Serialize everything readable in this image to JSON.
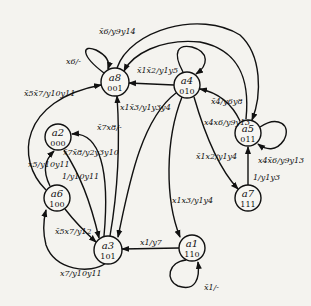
{
  "diagram": {
    "type": "state-machine",
    "nodes": [
      {
        "id": "a8",
        "label": "a8",
        "code": "001",
        "x": 115,
        "y": 82
      },
      {
        "id": "a4",
        "label": "a4",
        "code": "010",
        "x": 187,
        "y": 85
      },
      {
        "id": "a5",
        "label": "a5",
        "code": "011",
        "x": 248,
        "y": 133
      },
      {
        "id": "a7",
        "label": "a7",
        "code": "111",
        "x": 248,
        "y": 198
      },
      {
        "id": "a2",
        "label": "a2",
        "code": "000",
        "x": 58,
        "y": 137
      },
      {
        "id": "a6",
        "label": "a6",
        "code": "100",
        "x": 57,
        "y": 198
      },
      {
        "id": "a3",
        "label": "a3",
        "code": "101",
        "x": 108,
        "y": 250
      },
      {
        "id": "a1",
        "label": "a1",
        "code": "110",
        "x": 192,
        "y": 248
      }
    ],
    "edges": [
      {
        "from": "a8",
        "to": "a8",
        "label": "x6/-"
      },
      {
        "from": "a8",
        "to": "a5",
        "label": "x̄6/y9y14"
      },
      {
        "from": "a5",
        "to": "a8",
        "label": ""
      },
      {
        "from": "a4",
        "to": "a8",
        "label": "x̄1x̄2/y1y5"
      },
      {
        "from": "a4",
        "to": "a3",
        "label": "x1x̄3/y1y3y4"
      },
      {
        "from": "a3",
        "to": "a8",
        "label": "x̄7x8/-"
      },
      {
        "from": "a6",
        "to": "a8",
        "label": "x̄5x̄7/y10y11"
      },
      {
        "from": "a3",
        "to": "a2",
        "label": "x̄7x̄8/y2y3y10"
      },
      {
        "from": "a6",
        "to": "a2",
        "label": "x5/y10y11"
      },
      {
        "from": "a2",
        "to": "a3",
        "label": "1/y10y11"
      },
      {
        "from": "a6",
        "to": "a3",
        "label": "x̄5x7/y12"
      },
      {
        "from": "a3",
        "to": "a6",
        "label": "x7/y10y11"
      },
      {
        "from": "a4",
        "to": "a4",
        "label": "x̄4/y6y8"
      },
      {
        "from": "a5",
        "to": "a4",
        "label": "x4x6/y9y13"
      },
      {
        "from": "a5",
        "to": "a5",
        "label": "x4x̄6/y9y13"
      },
      {
        "from": "a4",
        "to": "a7",
        "label": "x̄1x2/y1y4"
      },
      {
        "from": "a7",
        "to": "a5",
        "label": "1/y1y3"
      },
      {
        "from": "a4",
        "to": "a1",
        "label": "x1x3/y1y4"
      },
      {
        "from": "a1",
        "to": "a3",
        "label": "x1/y7"
      },
      {
        "from": "a1",
        "to": "a1",
        "label": "x̄1/-"
      }
    ]
  },
  "labels": {
    "a8": "a8",
    "a8_code": "001",
    "a4": "a4",
    "a4_code": "010",
    "a5": "a5",
    "a5_code": "011",
    "a7": "a7",
    "a7_code": "111",
    "a2": "a2",
    "a2_code": "000",
    "a6": "a6",
    "a6_code": "100",
    "a3": "a3",
    "a3_code": "101",
    "a1": "a1",
    "a1_code": "110",
    "e_a8_self": "x6/-",
    "e_a8_a5": "x̄6/y9y14",
    "e_a4_a8": "x̄1x̄2/y1y5",
    "e_a4_a3": "x1x̄3/y1y3y4",
    "e_a3_a8": "x̄7x8/-",
    "e_a6_a8": "x̄5x̄7/y10y11",
    "e_a3_a2": "x̄7x̄8/y2y3y10",
    "e_a6_a2": "x5/y10y11",
    "e_a2_a3": "1/y10y11",
    "e_a6_a3": "x̄5x7/y12",
    "e_a3_a6": "x7/y10y11",
    "e_a4_self": "x̄4/y6y8",
    "e_a5_a4": "x4x6/y9y13",
    "e_a5_self": "x4x̄6/y9y13",
    "e_a4_a7": "x̄1x2/y1y4",
    "e_a7_a5": "1/y1y3",
    "e_a4_a1": "x1x3/y1y4",
    "e_a1_a3": "x1/y7",
    "e_a1_self": "x̄1/-"
  }
}
